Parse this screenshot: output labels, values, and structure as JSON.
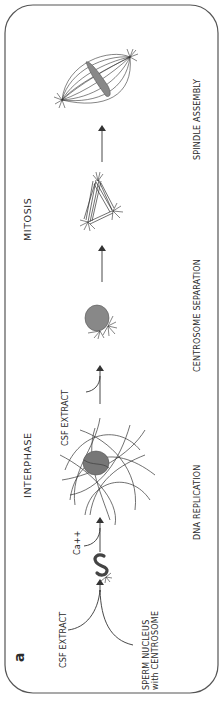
{
  "figure": {
    "panel_label": "a",
    "orientation": "rotated-90-ccw",
    "colors": {
      "line": "#333333",
      "nucleus_fill": "#777777",
      "border": "#555555"
    },
    "phases": {
      "interphase": "INTERPHASE",
      "mitosis": "MITOSIS"
    },
    "inputs": {
      "csf_extract_1": "CSF   EXTRACT",
      "sperm_line1": "SPERM   NUCLEUS",
      "sperm_line2": "with   CENTROSOME",
      "calcium": "Ca++",
      "csf_extract_2": "CSF   EXTRACT"
    },
    "stages": [
      {
        "name": "DNA   REPLICATION"
      },
      {
        "name": "CENTROSOME   SEPARATION"
      },
      {
        "name": "SPINDLE   ASSEMBLY"
      }
    ],
    "sequence": [
      "sperm-nucleus",
      "interphase-nucleus",
      "centrosome-nucleus",
      "separated-asters",
      "bipolar-spindle"
    ]
  }
}
